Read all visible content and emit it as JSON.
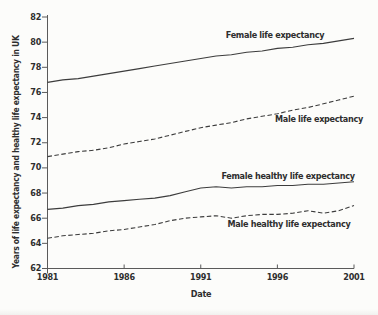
{
  "figure": {
    "y_axis_title": "Years of life expectancy and healthy life expectancy in UK",
    "x_axis_title": "Date"
  },
  "chart_data": {
    "type": "line",
    "title": "",
    "xlabel": "Date",
    "ylabel": "Years of life expectancy and healthy life expectancy in UK",
    "xlim": [
      1981,
      2001
    ],
    "ylim": [
      62,
      82
    ],
    "x_ticks": [
      1981,
      1986,
      1991,
      1996,
      2001
    ],
    "y_ticks": [
      62,
      64,
      66,
      68,
      70,
      72,
      74,
      76,
      78,
      80,
      82
    ],
    "grid": false,
    "legend": "inline-labels",
    "x": [
      1981,
      1982,
      1983,
      1984,
      1985,
      1986,
      1987,
      1988,
      1989,
      1990,
      1991,
      1992,
      1993,
      1994,
      1995,
      1996,
      1997,
      1998,
      1999,
      2000,
      2001
    ],
    "series": [
      {
        "name": "Female life expectancy",
        "style": "solid",
        "values": [
          76.8,
          77.0,
          77.1,
          77.3,
          77.5,
          77.7,
          77.9,
          78.1,
          78.3,
          78.5,
          78.7,
          78.9,
          79.0,
          79.2,
          79.3,
          79.5,
          79.6,
          79.8,
          79.9,
          80.1,
          80.3
        ]
      },
      {
        "name": "Male life expectancy",
        "style": "dashed",
        "values": [
          70.9,
          71.1,
          71.3,
          71.4,
          71.6,
          71.9,
          72.1,
          72.3,
          72.6,
          72.9,
          73.2,
          73.4,
          73.6,
          73.9,
          74.1,
          74.3,
          74.6,
          74.8,
          75.1,
          75.4,
          75.7
        ]
      },
      {
        "name": "Female healthy life expectancy",
        "style": "solid",
        "values": [
          66.7,
          66.8,
          67.0,
          67.1,
          67.3,
          67.4,
          67.5,
          67.6,
          67.8,
          68.1,
          68.4,
          68.5,
          68.4,
          68.5,
          68.5,
          68.6,
          68.6,
          68.7,
          68.7,
          68.8,
          68.9
        ]
      },
      {
        "name": "Male healthy life expectancy",
        "style": "dashed",
        "values": [
          64.4,
          64.6,
          64.7,
          64.8,
          65.0,
          65.1,
          65.3,
          65.5,
          65.8,
          66.0,
          66.1,
          66.2,
          66.0,
          66.2,
          66.3,
          66.3,
          66.4,
          66.6,
          66.4,
          66.6,
          67.0
        ]
      }
    ],
    "colors": {
      "line": "#3c3c3c",
      "axis": "#5a5a5a",
      "text": "#2e2e2e",
      "background": "#fcfcfa"
    }
  }
}
